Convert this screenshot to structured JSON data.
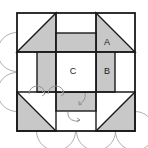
{
  "figure": {
    "canvas": {
      "width": 148,
      "height": 148,
      "background": "#ffffff"
    },
    "square": {
      "x": 17,
      "y": 13,
      "size": 118,
      "stroke": "#1a1a1a",
      "stroke_width": 1.6
    },
    "colors": {
      "fill_gray": "#c8c8c8",
      "fill_white": "#ffffff",
      "stroke_dark": "#1a1a1a",
      "stroke_arc": "#9a9a9a",
      "label_text": "#1a1a1a"
    },
    "grid": {
      "vertical_lines": [
        17,
        56,
        96,
        135
      ],
      "horizontal_lines": [
        13,
        52,
        92,
        131
      ],
      "band_inset": 39
    },
    "labels": [
      {
        "id": "label-a",
        "text": "A",
        "x": 107,
        "y": 43
      },
      {
        "id": "label-b",
        "text": "B",
        "x": 107,
        "y": 72
      },
      {
        "id": "label-c",
        "text": "C",
        "x": 73,
        "y": 72
      }
    ],
    "corner_triangles": [
      {
        "id": "triangle-top-left",
        "points": "17,52 56,13 56,52",
        "fill": "#c8c8c8"
      },
      {
        "id": "triangle-top-right",
        "points": "96,13 135,52 96,52",
        "fill": "#c8c8c8"
      },
      {
        "id": "triangle-bottom-left",
        "points": "17,92 56,131 17,131",
        "fill": "#c8c8c8"
      },
      {
        "id": "triangle-bottom-right",
        "points": "96,131 135,92 135,131",
        "fill": "#c8c8c8"
      }
    ],
    "gray_bars": [
      {
        "id": "bar-top",
        "x": 56,
        "y": 33,
        "width": 40,
        "height": 19,
        "fill": "#c8c8c8"
      },
      {
        "id": "bar-bottom",
        "x": 56,
        "y": 92,
        "width": 40,
        "height": 19,
        "fill": "#c8c8c8"
      },
      {
        "id": "bar-left",
        "x": 37,
        "y": 52,
        "width": 19,
        "height": 40,
        "fill": "#c8c8c8"
      },
      {
        "id": "bar-right",
        "x": 96,
        "y": 52,
        "width": 19,
        "height": 40,
        "fill": "#c8c8c8"
      }
    ],
    "center_square": {
      "id": "center-region",
      "x": 56,
      "y": 52,
      "width": 40,
      "height": 40,
      "fill": "#ffffff"
    },
    "arcs": [
      {
        "id": "arc-left-upper",
        "cx": 17,
        "cy": 52,
        "r": 19.5
      },
      {
        "id": "arc-left-lower",
        "cx": 17,
        "cy": 92,
        "r": 19.5
      },
      {
        "id": "arc-bottom-left",
        "cx": 56,
        "cy": 131,
        "r": 19.5
      },
      {
        "id": "arc-bottom-mid",
        "cx": 96,
        "cy": 131,
        "r": 19.5
      },
      {
        "id": "arc-bottom-right",
        "cx": 135,
        "cy": 131,
        "r": 19.5
      },
      {
        "id": "arc-inner-pivot",
        "cx": 76,
        "cy": 92,
        "r": 19.5
      }
    ],
    "rotation_arrows": [
      {
        "id": "rotation-arrow-left",
        "cx": 37,
        "cy": 93,
        "r": 8
      },
      {
        "id": "rotation-arrow-middle",
        "cx": 56,
        "cy": 93,
        "r": 8
      },
      {
        "id": "rotation-arrow-pivot",
        "cx": 76,
        "cy": 98,
        "r": 9
      },
      {
        "id": "rotation-arrow-lower",
        "cx": 76,
        "cy": 116,
        "r": 8
      }
    ]
  }
}
